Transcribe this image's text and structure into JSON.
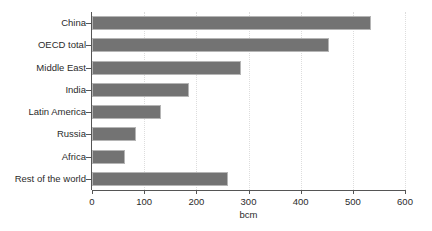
{
  "chart_data": {
    "type": "bar",
    "orientation": "horizontal",
    "title": "",
    "subtitle": "",
    "xlabel": "bcm",
    "ylabel": "",
    "xlim": [
      0,
      600
    ],
    "xticks": [
      0,
      100,
      200,
      300,
      400,
      500,
      600
    ],
    "xtick_labels": [
      "0",
      "100",
      "200",
      "300",
      "400",
      "500",
      "600"
    ],
    "grid": "vertical-dotted",
    "legend": null,
    "categories": [
      "China",
      "OECD total",
      "Middle East",
      "India",
      "Latin America",
      "Russia",
      "Africa",
      "Rest of the world"
    ],
    "values": [
      535,
      455,
      285,
      185,
      133,
      84,
      63,
      260
    ],
    "series": [
      {
        "name": "Gas demand",
        "values": [
          535,
          455,
          285,
          185,
          133,
          84,
          63,
          260
        ]
      }
    ]
  },
  "style": {
    "bar_color": "#737373",
    "bar_border_color": "#b5b5b5",
    "axis_color": "#555555",
    "grid_color": "#dddddd",
    "background": "#ffffff",
    "text_color": "#2b2b2b"
  }
}
